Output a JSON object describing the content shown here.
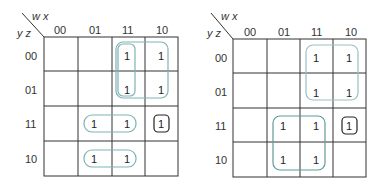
{
  "maps": [
    {
      "id": "left",
      "col_var_label": "w x",
      "row_var_label": "y z",
      "col_headers": [
        "00",
        "01",
        "11",
        "10"
      ],
      "row_headers": [
        "00",
        "01",
        "11",
        "10"
      ],
      "cells": [
        [
          "",
          "",
          "1",
          "1"
        ],
        [
          "",
          "",
          "1",
          "1"
        ],
        [
          "",
          "1",
          "1",
          "1"
        ],
        [
          "",
          "1",
          "1",
          ""
        ]
      ],
      "groups": [
        {
          "name": "group-col-11-rows-00-01",
          "rows": [
            0,
            1
          ],
          "cols": [
            2,
            2
          ],
          "color": "#7fb3b3"
        },
        {
          "name": "group-cols-11-10-rows-00-01",
          "rows": [
            0,
            1
          ],
          "cols": [
            2,
            3
          ],
          "color": "#7fb3b3"
        },
        {
          "name": "group-row-11-cols-01-11",
          "rows": [
            2,
            2
          ],
          "cols": [
            1,
            2
          ],
          "color": "#7fb3b3"
        },
        {
          "name": "group-row-10-cols-01-11",
          "rows": [
            3,
            3
          ],
          "cols": [
            1,
            2
          ],
          "color": "#7fb3b3"
        },
        {
          "name": "group-single-11-10",
          "rows": [
            2,
            2
          ],
          "cols": [
            3,
            3
          ],
          "color": "#222222"
        }
      ]
    },
    {
      "id": "right",
      "col_var_label": "w x",
      "row_var_label": "y z",
      "col_headers": [
        "00",
        "01",
        "11",
        "10"
      ],
      "row_headers": [
        "00",
        "01",
        "11",
        "10"
      ],
      "cells": [
        [
          "",
          "",
          "1",
          "1"
        ],
        [
          "",
          "",
          "1",
          "1"
        ],
        [
          "",
          "1",
          "1",
          "1"
        ],
        [
          "",
          "1",
          "1",
          ""
        ]
      ],
      "groups": [
        {
          "name": "group-cols-11-10-rows-00-01",
          "rows": [
            0,
            1
          ],
          "cols": [
            2,
            3
          ],
          "color": "#9cc0c0"
        },
        {
          "name": "group-cols-01-11-rows-11-10",
          "rows": [
            2,
            3
          ],
          "cols": [
            1,
            2
          ],
          "color": "#5f9a9a"
        },
        {
          "name": "group-single-11-10",
          "rows": [
            2,
            2
          ],
          "cols": [
            3,
            3
          ],
          "color": "#222222"
        }
      ]
    }
  ]
}
